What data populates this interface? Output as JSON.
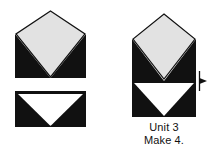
{
  "figure": {
    "kind": "quilt-block-unit-diagram",
    "caption": {
      "unit_label": "Unit 3",
      "make_label": "Make 4."
    }
  },
  "colors": {
    "background": "#ffffff",
    "dark_fabric": "#111111",
    "light_fabric": "#e2e2e2",
    "white_fabric": "#ffffff",
    "outline": "#111111",
    "text": "#111111",
    "arrow": "#111111"
  },
  "components": {
    "top_piece": {
      "name": "square-on-point-unit",
      "description": "Light gray square set on point with dark corner triangles at the two bottom corners",
      "center_shape": "diamond",
      "center_fill": "#e2e2e2",
      "corner_fill": "#111111",
      "corners_filled": [
        "bottom-left",
        "bottom-right"
      ]
    },
    "bottom_piece": {
      "name": "flying-geese-unit",
      "description": "Rectangle with a white downward-pointing triangle flanked by dark corner triangles",
      "center_shape": "inverted-triangle",
      "center_fill": "#ffffff",
      "corner_fill": "#111111",
      "corners_filled": [
        "top-left",
        "top-right"
      ]
    }
  },
  "assembled": {
    "name": "unit-3-assembled",
    "description": "Square-on-point unit joined above a flying geese unit",
    "stack_order": [
      "square-on-point-unit",
      "flying-geese-unit"
    ]
  },
  "press_arrow": {
    "name": "press-direction-arrow",
    "direction": "right",
    "description": "Seam pressing direction marker at the joining seam"
  }
}
